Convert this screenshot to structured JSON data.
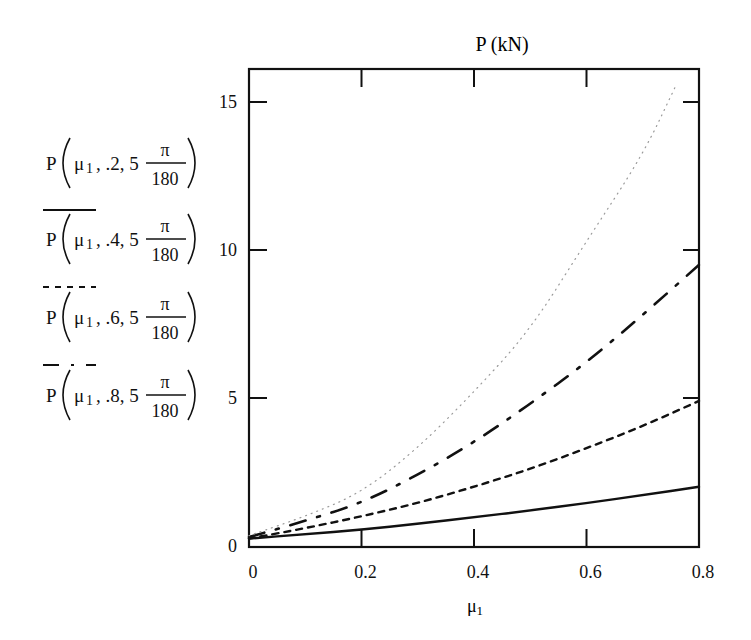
{
  "chart_data": {
    "type": "line",
    "title": "P (kN)",
    "xlabel": "μ1",
    "ylabel": "",
    "xlim": [
      0,
      0.8
    ],
    "ylim": [
      0,
      16
    ],
    "x_ticks": [
      "0",
      "0.2",
      "0.4",
      "0.6",
      "0.8"
    ],
    "y_ticks": [
      "0",
      "5",
      "10",
      "15"
    ],
    "grid": false,
    "legend_position": "left",
    "x": [
      0,
      0.1,
      0.2,
      0.3,
      0.4,
      0.5,
      0.6,
      0.7,
      0.8
    ],
    "series": [
      {
        "name": "P(μ1, .2, 5π/180)",
        "style": "solid",
        "values": [
          0.25,
          0.4,
          0.55,
          0.75,
          0.97,
          1.2,
          1.45,
          1.72,
          2.0
        ]
      },
      {
        "name": "P(μ1, .4, 5π/180)",
        "style": "dashed",
        "values": [
          0.25,
          0.6,
          1.0,
          1.45,
          2.0,
          2.6,
          3.3,
          4.05,
          4.9
        ]
      },
      {
        "name": "P(μ1, .6, 5π/180)",
        "style": "dash-dot",
        "values": [
          0.3,
          0.85,
          1.45,
          2.4,
          3.5,
          4.8,
          6.2,
          7.8,
          9.5
        ]
      },
      {
        "name": "P(μ1, .8, 5π/180)",
        "style": "dotted",
        "values": [
          0.35,
          1.0,
          1.8,
          3.3,
          5.2,
          7.3,
          10.3,
          13.2,
          null
        ],
        "note": "curve exits top of plot near μ1≈0.76 at ≈15.5"
      }
    ]
  },
  "legend": [
    {
      "prefix": "P",
      "arg1": "μ",
      "sub": "1",
      "arg2": ".2",
      "arg3": "5",
      "num": "π",
      "den": "180",
      "style": "solid"
    },
    {
      "prefix": "P",
      "arg1": "μ",
      "sub": "1",
      "arg2": ".4",
      "arg3": "5",
      "num": "π",
      "den": "180",
      "style": "dashed"
    },
    {
      "prefix": "P",
      "arg1": "μ",
      "sub": "1",
      "arg2": ".6",
      "arg3": "5",
      "num": "π",
      "den": "180",
      "style": "dash-dot"
    },
    {
      "prefix": "P",
      "arg1": "μ",
      "sub": "1",
      "arg2": ".8",
      "arg3": "5",
      "num": "π",
      "den": "180",
      "style": "dotted"
    }
  ],
  "axis": {
    "title": "P (kN)",
    "xlabel_main": "μ",
    "xlabel_sub": "1"
  }
}
